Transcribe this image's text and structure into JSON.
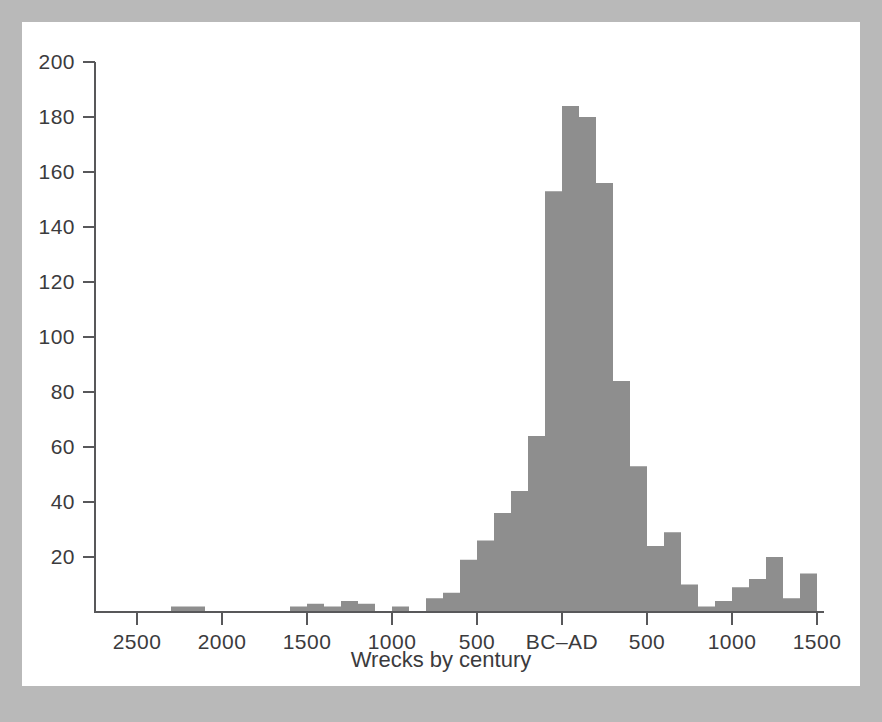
{
  "figure": {
    "background_color": "#b9b9b9",
    "card_color": "#ffffff",
    "bar_color": "#8e8e8e",
    "axis_color": "#58585a",
    "text_color": "#3b3b3d"
  },
  "chart_data": {
    "type": "bar",
    "title": "",
    "xlabel": "Wrecks by century",
    "ylabel": "",
    "grid": false,
    "legend": null,
    "ylim": [
      0,
      200
    ],
    "y_ticks": [
      20,
      40,
      60,
      80,
      100,
      120,
      140,
      160,
      180,
      200
    ],
    "y_tick_labels": [
      "20",
      "40",
      "60",
      "80",
      "100",
      "120",
      "140",
      "160",
      "180",
      "200"
    ],
    "x_ticks": [
      -2500,
      -2000,
      -1500,
      -1000,
      -500,
      0,
      500,
      1000,
      1500
    ],
    "x_tick_labels": [
      "2500",
      "2000",
      "1500",
      "1000",
      "500",
      "BC–AD",
      "500",
      "1000",
      "1500"
    ],
    "xlim": [
      -2800,
      1550
    ],
    "bin_width_years": 100,
    "categories": [
      "2300 BC",
      "2200 BC",
      "1600 BC",
      "1500 BC",
      "1400 BC",
      "1300 BC",
      "1200 BC",
      "1000 BC",
      "800 BC",
      "700 BC",
      "600 BC",
      "500 BC",
      "400 BC",
      "300 BC",
      "200 BC",
      "100 BC",
      "AD 1",
      "AD 100",
      "AD 200",
      "AD 300",
      "AD 400",
      "AD 500",
      "AD 600",
      "AD 700",
      "AD 800",
      "AD 900",
      "AD 1000",
      "AD 1100",
      "AD 1200",
      "AD 1300",
      "AD 1400"
    ],
    "bins": [
      {
        "start": -2300,
        "end": -2200,
        "value": 2
      },
      {
        "start": -2200,
        "end": -2100,
        "value": 2
      },
      {
        "start": -1600,
        "end": -1500,
        "value": 2
      },
      {
        "start": -1500,
        "end": -1400,
        "value": 3
      },
      {
        "start": -1400,
        "end": -1300,
        "value": 2
      },
      {
        "start": -1300,
        "end": -1200,
        "value": 4
      },
      {
        "start": -1200,
        "end": -1100,
        "value": 3
      },
      {
        "start": -1000,
        "end": -900,
        "value": 2
      },
      {
        "start": -800,
        "end": -700,
        "value": 5
      },
      {
        "start": -700,
        "end": -600,
        "value": 7
      },
      {
        "start": -600,
        "end": -500,
        "value": 19
      },
      {
        "start": -500,
        "end": -400,
        "value": 26
      },
      {
        "start": -400,
        "end": -300,
        "value": 36
      },
      {
        "start": -300,
        "end": -200,
        "value": 44
      },
      {
        "start": -200,
        "end": -100,
        "value": 64
      },
      {
        "start": -100,
        "end": 0,
        "value": 153
      },
      {
        "start": 0,
        "end": 100,
        "value": 184
      },
      {
        "start": 100,
        "end": 200,
        "value": 180
      },
      {
        "start": 200,
        "end": 300,
        "value": 156
      },
      {
        "start": 300,
        "end": 400,
        "value": 84
      },
      {
        "start": 400,
        "end": 500,
        "value": 53
      },
      {
        "start": 500,
        "end": 600,
        "value": 24
      },
      {
        "start": 600,
        "end": 700,
        "value": 29
      },
      {
        "start": 700,
        "end": 800,
        "value": 10
      },
      {
        "start": 800,
        "end": 900,
        "value": 2
      },
      {
        "start": 900,
        "end": 1000,
        "value": 4
      },
      {
        "start": 1000,
        "end": 1100,
        "value": 9
      },
      {
        "start": 1100,
        "end": 1200,
        "value": 12
      },
      {
        "start": 1200,
        "end": 1300,
        "value": 20
      },
      {
        "start": 1300,
        "end": 1400,
        "value": 5
      },
      {
        "start": 1400,
        "end": 1500,
        "value": 14
      }
    ]
  }
}
